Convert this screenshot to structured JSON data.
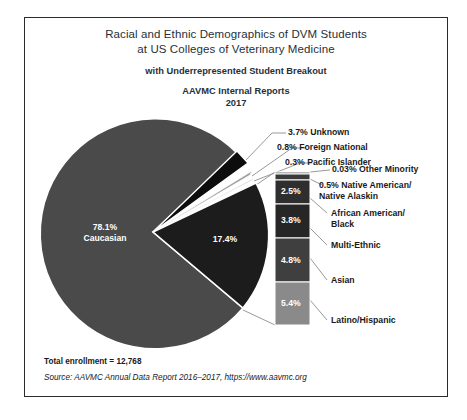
{
  "title": {
    "line1": "Racial and Ethnic Demographics of DVM Students",
    "line2": "at US Colleges of Veterinary Medicine",
    "sub1": "with Underrepresented Student Breakout",
    "sub2": "AAVMC Internal Reports",
    "year": "2017"
  },
  "pie": {
    "caucasian_pct": "78.1%",
    "caucasian_name": "Caucasian",
    "underrepresented_pct": "17.4%"
  },
  "callouts": [
    {
      "pct": "3.7%",
      "name": "Unknown"
    },
    {
      "pct": "0.8%",
      "name": "Foreign National"
    },
    {
      "pct": "0.3%",
      "name": "Pacific Islander"
    },
    {
      "pct": "0.03%",
      "name": "Other Minority"
    },
    {
      "pct": "0.5%",
      "name": "Native American/ Native Alaskin"
    },
    {
      "pct": "",
      "name": "African American/ Black"
    },
    {
      "pct": "",
      "name": "Multi-Ethnic"
    },
    {
      "pct": "",
      "name": "Asian"
    },
    {
      "pct": "",
      "name": "Latino/Hispanic"
    }
  ],
  "bar_labels": {
    "s1": "2.5%",
    "s2": "3.8%",
    "s3": "4.8%",
    "s4": "5.4%"
  },
  "footer": {
    "total": "Total enrollment = 12,768",
    "source": "Source: AAVMC Annual Data Report 2016–2017, https://www.aavmc.org"
  },
  "colors": {
    "caucasian": "#4a4a4a",
    "underrepresented": "#1c1c1c",
    "unknown": "#0d0d0d",
    "foreign_national": "#9a9a9a",
    "pacific_islander": "#d0d0d0",
    "bar_other_minority": "#6e6e6e",
    "bar_native_american": "#3a3a3a",
    "bar_african_american": "#2e2e2e",
    "bar_multi_ethnic": "#262626",
    "bar_asian": "#3f3f3f",
    "bar_latino": "#8a8a8a",
    "frame": "#2b2b2b",
    "text": "#1a1a1a",
    "title_text": "#26303a"
  },
  "chart_data": {
    "type": "pie",
    "title": "Racial and Ethnic Demographics of DVM Students at US Colleges of Veterinary Medicine",
    "subtitle": "with Underrepresented Student Breakout — AAVMC Internal Reports 2017",
    "total_enrollment": 12768,
    "categories": [
      "Caucasian",
      "Underrepresented (total)",
      "Unknown",
      "Foreign National",
      "Pacific Islander"
    ],
    "values": [
      78.1,
      17.4,
      3.7,
      0.8,
      0.3
    ],
    "units": "percent",
    "breakout": {
      "type": "bar",
      "orientation": "stacked-vertical",
      "parent_slice": "Underrepresented (total)",
      "parent_value": 17.4,
      "categories": [
        "Other Minority",
        "Native American/Native Alaskin",
        "African American/Black",
        "Multi-Ethnic",
        "Asian",
        "Latino/Hispanic"
      ],
      "values": [
        0.03,
        0.5,
        2.5,
        3.8,
        4.8,
        5.4
      ]
    },
    "legend": "none",
    "grid": false,
    "source": "AAVMC Annual Data Report 2016–2017, https://www.aavmc.org"
  }
}
